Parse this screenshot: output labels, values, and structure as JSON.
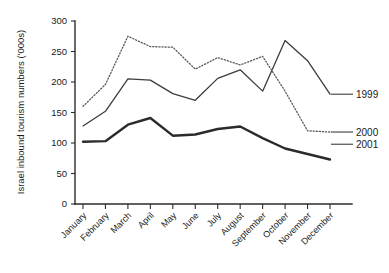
{
  "chart_data": {
    "type": "line",
    "title": "",
    "xlabel": "",
    "ylabel": "Israel inbound tourism numbers ('000s)",
    "ylim": [
      0,
      300
    ],
    "yticks": [
      0,
      50,
      100,
      150,
      200,
      250,
      300
    ],
    "ytick_labels": [
      "0",
      "50",
      "100",
      "150",
      "200",
      "250",
      "300"
    ],
    "grid": false,
    "legend_position": "right-inline",
    "categories": [
      "January",
      "February",
      "March",
      "April",
      "May",
      "June",
      "July",
      "August",
      "September",
      "October",
      "November",
      "December"
    ],
    "series": [
      {
        "name": "1999",
        "style": "solid-thin",
        "color": "#3c3c3c",
        "values": [
          128,
          152,
          205,
          203,
          181,
          170,
          206,
          220,
          185,
          268,
          235,
          180
        ]
      },
      {
        "name": "2000",
        "style": "dotted",
        "color": "#5a5a5a",
        "values": [
          160,
          196,
          275,
          258,
          257,
          221,
          240,
          228,
          242,
          185,
          120,
          118
        ]
      },
      {
        "name": "2001",
        "style": "solid-thick",
        "color": "#2b2b2b",
        "values": [
          102,
          103,
          130,
          141,
          112,
          114,
          123,
          127,
          108,
          91,
          82,
          73
        ]
      }
    ],
    "series_labels": [
      {
        "text": "1999",
        "value": 180
      },
      {
        "text": "2000",
        "value": 118
      },
      {
        "text": "2001",
        "value": 98
      }
    ]
  }
}
